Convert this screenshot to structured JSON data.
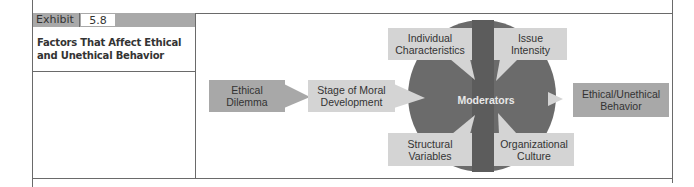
{
  "exhibit": {
    "label": "Exhibit",
    "number": "5.8",
    "title": "Factors That Affect Ethical and Unethical Behavior"
  },
  "diagram": {
    "nodes": {
      "ethical_dilemma": "Ethical Dilemma",
      "stage_moral_development": "Stage of Moral Development",
      "moderators": "Moderators",
      "outcome": "Ethical/Unethical Behavior",
      "individual_characteristics": "Individual Characteristics",
      "issue_intensity": "Issue Intensity",
      "structural_variables": "Structural Variables",
      "organizational_culture": "Organizational Culture"
    },
    "flow": [
      "Ethical Dilemma",
      "Stage of Moral Development",
      "Moderators",
      "Ethical/Unethical Behavior"
    ],
    "moderators": [
      "Individual Characteristics",
      "Issue Intensity",
      "Structural Variables",
      "Organizational Culture"
    ],
    "colors": {
      "circle": "#6b6b6b",
      "dark_box": "#a8a8a8",
      "light_box": "#d4d4d4",
      "rule": "#6a6a6a"
    }
  }
}
